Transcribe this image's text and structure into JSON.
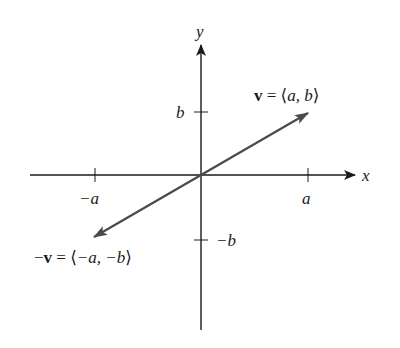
{
  "diagram": {
    "type": "vector-diagram",
    "axes": {
      "x_label": "x",
      "y_label": "y",
      "color": "#1a1a1a"
    },
    "ticks": {
      "x_positive": "a",
      "x_negative": "−a",
      "y_positive": "b",
      "y_negative": "−b"
    },
    "vectors": [
      {
        "name": "v",
        "label_prefix": "v",
        "label_eq": " = ⟨",
        "label_components": "a, b",
        "label_close": "⟩",
        "full_label": "v = ⟨a, b⟩",
        "direction": "first-quadrant",
        "color": "#4a4a4a"
      },
      {
        "name": "negative-v",
        "label_minus": "−",
        "label_prefix": "v",
        "label_eq": " = ⟨",
        "label_components": "−a, −b",
        "label_close": "⟩",
        "full_label": "−v = ⟨−a, −b⟩",
        "direction": "third-quadrant",
        "color": "#4a4a4a"
      }
    ]
  }
}
